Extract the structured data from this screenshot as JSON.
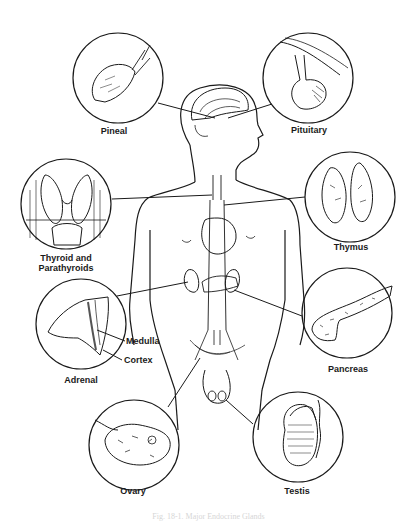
{
  "diagram": {
    "glands": [
      {
        "id": "pineal",
        "label": "Pineal"
      },
      {
        "id": "pituitary",
        "label": "Pituitary"
      },
      {
        "id": "thyroid",
        "label_line1": "Thyroid and",
        "label_line2": "Parathyroids"
      },
      {
        "id": "thymus",
        "label": "Thymus"
      },
      {
        "id": "adrenal",
        "label": "Adrenal",
        "parts": [
          "Medulla",
          "Cortex"
        ]
      },
      {
        "id": "pancreas",
        "label": "Pancreas"
      },
      {
        "id": "ovary",
        "label": "Ovary"
      },
      {
        "id": "testis",
        "label": "Testis"
      }
    ],
    "caption": "Fig. 18-1. Major Endocrine Glands"
  },
  "colors": {
    "ink": "#1a1a1a",
    "background": "#ffffff",
    "caption": "#d6d6d6"
  }
}
